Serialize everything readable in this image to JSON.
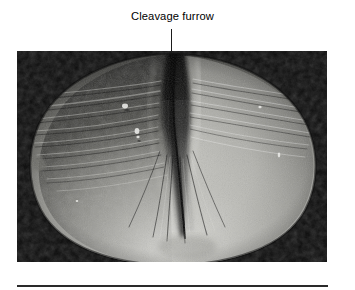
{
  "figure": {
    "background_color": "#ffffff",
    "label": {
      "text": "Cleavage furrow",
      "color": "#000000"
    },
    "leader_line": {
      "color": "#1b1b1b",
      "orientation": "vertical"
    },
    "micrograph": {
      "alt": "Scanning electron micrograph of a dividing cell constricted by a cleavage furrow",
      "background_color": "#0b0b0b",
      "subject": "dividing cell",
      "feature": "cleavage furrow",
      "highlight_color": "#d8d8d4",
      "midtone_color": "#8d8d88",
      "shadow_color": "#1a1a1a"
    },
    "rule": {
      "color": "#2a2a2a"
    }
  }
}
